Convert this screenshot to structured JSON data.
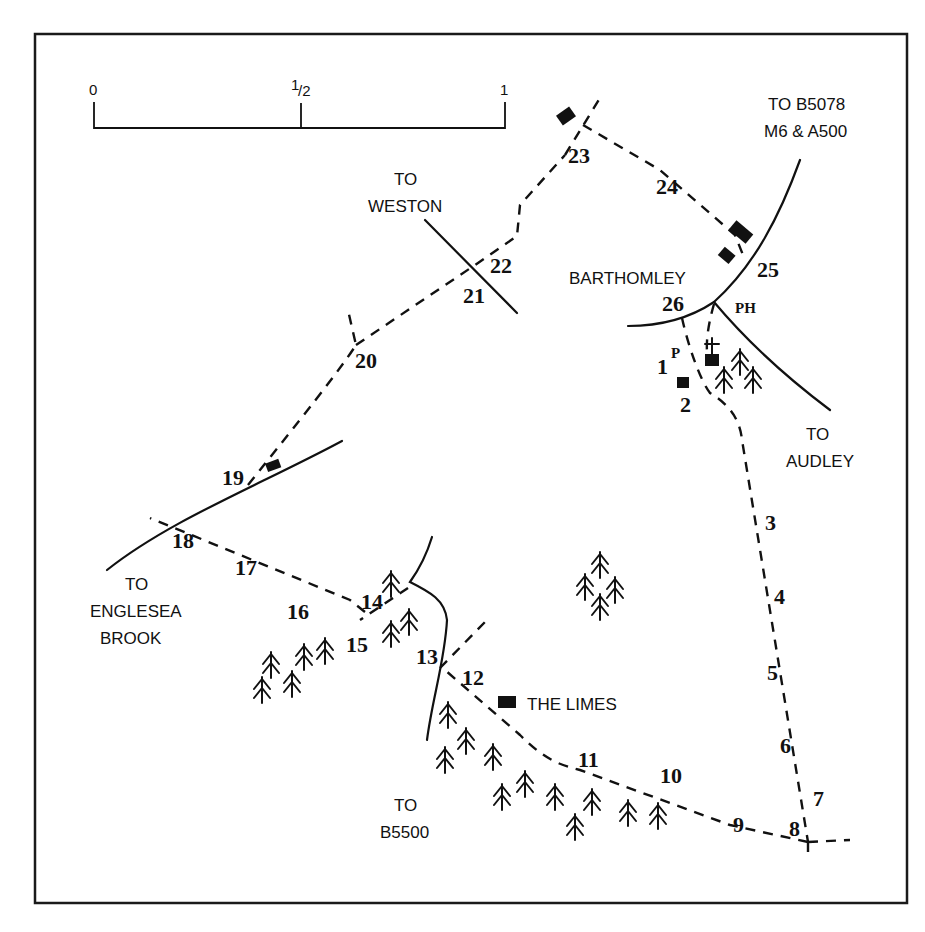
{
  "map": {
    "title": "Barthomley walk route map",
    "scale": {
      "ticks": [
        "0",
        "1/2",
        "1"
      ],
      "half_sup": "1",
      "half_sub": "2"
    },
    "places": {
      "barthomley": "BARTHOMLEY",
      "the_limes": "THE LIMES",
      "ph": "PH",
      "p": "P"
    },
    "road_labels": {
      "b5078_line1": "TO B5078",
      "b5078_line2": "M6 & A500",
      "weston_line1": "TO",
      "weston_line2": "WESTON",
      "audley_line1": "TO",
      "audley_line2": "AUDLEY",
      "englesea_line1": "TO",
      "englesea_line2": "ENGLESEA",
      "englesea_line3": "BROOK",
      "b5500_line1": "TO",
      "b5500_line2": "B5500"
    },
    "waypoints": [
      "1",
      "2",
      "3",
      "4",
      "5",
      "6",
      "7",
      "8",
      "9",
      "10",
      "11",
      "12",
      "13",
      "14",
      "15",
      "16",
      "17",
      "18",
      "19",
      "20",
      "21",
      "22",
      "23",
      "24",
      "25",
      "26"
    ]
  }
}
